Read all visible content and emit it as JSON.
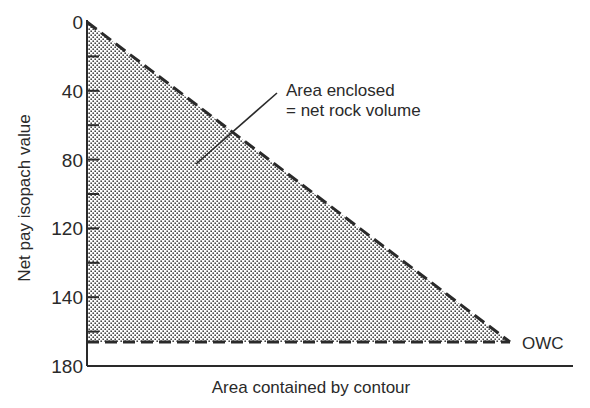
{
  "chart_data": {
    "type": "area",
    "title": "",
    "xlabel": "Area contained by contour",
    "ylabel": "Net pay isopach value",
    "y_axis_inverted": true,
    "ylim": [
      0,
      180
    ],
    "y_tick_labels": [
      "0",
      "40",
      "80",
      "120",
      "140",
      "180"
    ],
    "y_tick_count_minor_between_labels": 1,
    "grid": false,
    "series": [
      {
        "name": "isopach curve",
        "style": "dashed",
        "points": [
          {
            "x": 0,
            "y": 0
          },
          {
            "x": 1,
            "y": 162
          }
        ]
      },
      {
        "name": "OWC level",
        "style": "dashed",
        "points": [
          {
            "x": 0,
            "y": 162
          },
          {
            "x": 1,
            "y": 162
          }
        ]
      }
    ],
    "fill": {
      "pattern": "stipple",
      "region": "enclosed by curve, OWC and y-axis"
    },
    "annotations": [
      {
        "text_lines": [
          "Area enclosed",
          "= net rock volume"
        ],
        "points_to": "shaded area"
      },
      {
        "text": "OWC",
        "position": "right of OWC line end"
      }
    ]
  },
  "colors": {
    "ink": "#2a2a2a",
    "stipple": "#555555",
    "background": "#ffffff"
  }
}
